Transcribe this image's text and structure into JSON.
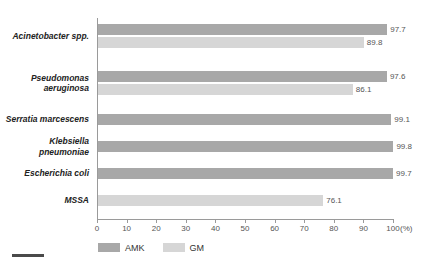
{
  "chart_data": {
    "type": "bar",
    "orientation": "horizontal",
    "title": "",
    "xlabel": "(%)",
    "ylabel": "",
    "xlim": [
      0,
      100
    ],
    "grid": false,
    "legend_position": "bottom-left",
    "axis_unit": "(%)",
    "tick_labels": [
      "0",
      "10",
      "20",
      "30",
      "40",
      "50",
      "60",
      "70",
      "80",
      "90",
      "100"
    ],
    "tick_values": [
      0,
      10,
      20,
      30,
      40,
      50,
      60,
      70,
      80,
      90,
      100
    ],
    "categories": [
      "Acinetobacter spp.",
      "Pseudomonas\naeruginosa",
      "Serratia marcescens",
      "Klebsiella\npneumoniae",
      "Escherichia coli",
      "MSSA"
    ],
    "series": [
      {
        "name": "AMK",
        "color": "#a8a8a8",
        "values": [
          97.7,
          97.6,
          99.1,
          99.8,
          99.7,
          null
        ]
      },
      {
        "name": "GM",
        "color": "#d6d6d6",
        "values": [
          89.8,
          86.1,
          null,
          null,
          null,
          76.1
        ]
      }
    ],
    "bars": [
      {
        "category": "Acinetobacter spp.",
        "series": "AMK",
        "value": 97.7,
        "label": "97.7",
        "color": "#a8a8a8"
      },
      {
        "category": "Acinetobacter spp.",
        "series": "GM",
        "value": 89.8,
        "label": "89.8",
        "color": "#d6d6d6"
      },
      {
        "category": "Pseudomonas aeruginosa",
        "series": "AMK",
        "value": 97.6,
        "label": "97.6",
        "color": "#a8a8a8"
      },
      {
        "category": "Pseudomonas aeruginosa",
        "series": "GM",
        "value": 86.1,
        "label": "86.1",
        "color": "#d6d6d6"
      },
      {
        "category": "Serratia marcescens",
        "series": "AMK",
        "value": 99.1,
        "label": "99.1",
        "color": "#a8a8a8"
      },
      {
        "category": "Klebsiella pneumoniae",
        "series": "AMK",
        "value": 99.8,
        "label": "99.8",
        "color": "#a8a8a8"
      },
      {
        "category": "Escherichia coli",
        "series": "AMK",
        "value": 99.7,
        "label": "99.7",
        "color": "#a8a8a8"
      },
      {
        "category": "MSSA",
        "series": "GM",
        "value": 76.1,
        "label": "76.1",
        "color": "#d6d6d6"
      }
    ]
  },
  "legend": {
    "items": [
      {
        "label": "AMK",
        "color": "#a8a8a8"
      },
      {
        "label": "GM",
        "color": "#d6d6d6"
      }
    ]
  },
  "colors": {
    "amk": "#a8a8a8",
    "gm": "#d6d6d6",
    "axis": "#9a9a9a",
    "text": "#444444",
    "background": "#ffffff"
  }
}
